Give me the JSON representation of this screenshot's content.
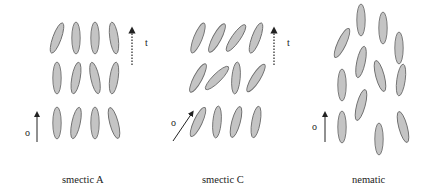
{
  "panels": [
    {
      "id": "smectic-a",
      "caption": "smectic A",
      "director_label": "o",
      "layer_normal_label": "t",
      "director_angle_deg": 0,
      "molecule_tilts_deg": [
        [
          20,
          0,
          0,
          -8
        ],
        [
          0,
          10,
          -12,
          8
        ],
        [
          0,
          12,
          0,
          -15
        ]
      ]
    },
    {
      "id": "smectic-c",
      "caption": "smectic C",
      "director_label": "o",
      "layer_normal_label": "t",
      "director_angle_deg": 32,
      "molecule_tilts_deg": [
        [
          22,
          28,
          35,
          20
        ],
        [
          28,
          45,
          5,
          32
        ],
        [
          25,
          5,
          15,
          10
        ]
      ]
    },
    {
      "id": "nematic",
      "caption": "nematic",
      "director_label": "o",
      "layer_normal_label": "t",
      "director_angle_deg": 0,
      "molecule_tilts_deg": [
        25,
        0,
        0,
        0,
        12,
        -15,
        8,
        0,
        15,
        0,
        0,
        -15
      ]
    }
  ]
}
